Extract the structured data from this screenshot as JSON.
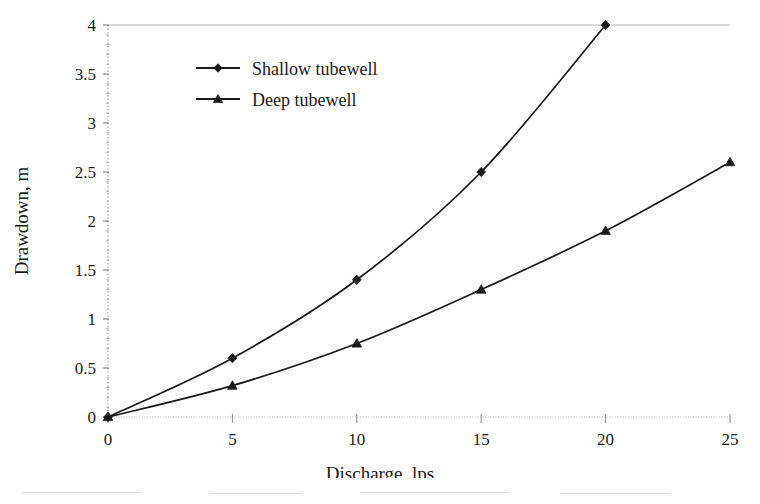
{
  "chart_data": {
    "type": "line",
    "title": "",
    "xlabel": "Discharge, lps",
    "ylabel": "Drawdown, m",
    "xlim": [
      0,
      25
    ],
    "ylim": [
      0,
      4
    ],
    "xticks": [
      "0",
      "5",
      "10",
      "15",
      "20",
      "25"
    ],
    "xtick_values": [
      0,
      5,
      10,
      15,
      20,
      25
    ],
    "yticks": [
      "0",
      "0.5",
      "1",
      "1.5",
      "2",
      "2.5",
      "3",
      "3.5",
      "4"
    ],
    "ytick_values": [
      0,
      0.5,
      1,
      1.5,
      2,
      2.5,
      3,
      3.5,
      4
    ],
    "grid": "horizontal-top-and-baseline-only",
    "legend_position": "upper-left-inside",
    "series": [
      {
        "name": "Shallow tubewell",
        "marker": "diamond",
        "color": "#1a1a1a",
        "x": [
          0,
          5,
          10,
          15,
          20
        ],
        "values": [
          0,
          0.6,
          1.4,
          2.5,
          4.0
        ]
      },
      {
        "name": "Deep tubewell",
        "marker": "triangle",
        "color": "#1a1a1a",
        "x": [
          0,
          5,
          10,
          15,
          20,
          25
        ],
        "values": [
          0,
          0.32,
          0.75,
          1.3,
          1.9,
          2.6
        ]
      }
    ]
  },
  "axes": {
    "x_title": "Discharge, lps",
    "y_title": "Drawdown, m"
  },
  "legend": {
    "items": [
      {
        "label": "Shallow tubewell",
        "marker": "diamond-marker-icon"
      },
      {
        "label": "Deep tubewell",
        "marker": "triangle-marker-icon"
      }
    ]
  },
  "xtick_labels": [
    "0",
    "5",
    "10",
    "15",
    "20",
    "25"
  ],
  "ytick_labels": [
    "0",
    "0.5",
    "1",
    "1.5",
    "2",
    "2.5",
    "3",
    "3.5",
    "4"
  ],
  "colors": {
    "ink": "#1a1a1a",
    "gridline": "#b5b5b5",
    "axis": "#8c8c8c",
    "background": "#ffffff"
  }
}
